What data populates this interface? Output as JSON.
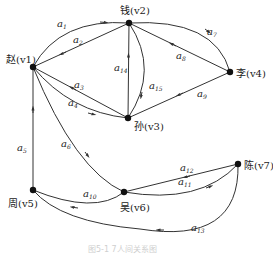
{
  "figure": {
    "caption": "图5-1  7人间关系图"
  },
  "nodes": [
    {
      "id": "v1",
      "name": "赵",
      "label": "赵(v1)",
      "x": 33,
      "y": 67
    },
    {
      "id": "v2",
      "name": "钱",
      "label": "钱(v2)",
      "x": 129,
      "y": 23
    },
    {
      "id": "v3",
      "name": "孙",
      "label": "孙(v3)",
      "x": 128,
      "y": 118
    },
    {
      "id": "v4",
      "name": "李",
      "label": "李(v4)",
      "x": 230,
      "y": 72
    },
    {
      "id": "v5",
      "name": "周",
      "label": "周(v5)",
      "x": 33,
      "y": 190
    },
    {
      "id": "v6",
      "name": "吴",
      "label": "吴(v6)",
      "x": 124,
      "y": 192
    },
    {
      "id": "v7",
      "name": "陈",
      "label": "陈(v7)",
      "x": 238,
      "y": 164
    }
  ],
  "edges": [
    {
      "id": "a1",
      "from": "v1",
      "to": "v2",
      "label": "a",
      "sub": "1"
    },
    {
      "id": "a2",
      "from": "v2",
      "to": "v1",
      "label": "a",
      "sub": "2"
    },
    {
      "id": "a3",
      "from": "v3",
      "to": "v1",
      "label": "a",
      "sub": "3"
    },
    {
      "id": "a4",
      "from": "v1",
      "to": "v3",
      "label": "a",
      "sub": "4"
    },
    {
      "id": "a5",
      "from": "v5",
      "to": "v1",
      "label": "a",
      "sub": "5"
    },
    {
      "id": "a6",
      "from": "v1",
      "to": "v6",
      "label": "a",
      "sub": "6"
    },
    {
      "id": "a7",
      "from": "v2",
      "to": "v4",
      "label": "a",
      "sub": "7"
    },
    {
      "id": "a8",
      "from": "v4",
      "to": "v2",
      "label": "a",
      "sub": "8"
    },
    {
      "id": "a9",
      "from": "v4",
      "to": "v3",
      "label": "a",
      "sub": "9"
    },
    {
      "id": "a10",
      "from": "v6",
      "to": "v5",
      "label": "a",
      "sub": "10"
    },
    {
      "id": "a11",
      "from": "v6",
      "to": "v7",
      "label": "a",
      "sub": "11"
    },
    {
      "id": "a12",
      "from": "v7",
      "to": "v6",
      "label": "a",
      "sub": "12"
    },
    {
      "id": "a13",
      "from": "v7",
      "to": "v5",
      "label": "a",
      "sub": "13"
    },
    {
      "id": "a14",
      "from": "v3",
      "to": "v2",
      "label": "a",
      "sub": "14"
    },
    {
      "id": "a15",
      "from": "v2",
      "to": "v3",
      "label": "a",
      "sub": "15"
    }
  ]
}
